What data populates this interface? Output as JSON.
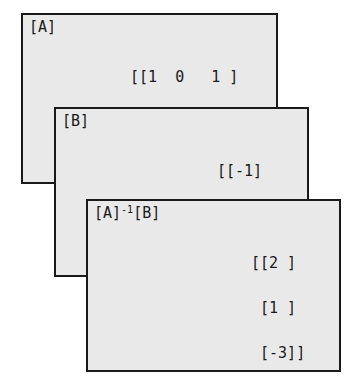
{
  "screens": [
    {
      "label": "[A]",
      "rows": [
        "[[1  0   1 ]",
        " [2  -2  -1]",
        " [3  0   0 ]]"
      ]
    },
    {
      "label": "[B]",
      "rows": [
        "[[-1]",
        " [5 ]",
        " [6 ]]"
      ]
    },
    {
      "label_base": "[A]",
      "label_sup": "-1",
      "label_tail": "[B]",
      "rows": [
        "[[2 ]",
        " [1 ]",
        " [-3]]"
      ]
    }
  ],
  "colors": {
    "screen_bg": "#e9e9e9",
    "border": "#1a1a1a",
    "text": "#1a1a1a"
  }
}
